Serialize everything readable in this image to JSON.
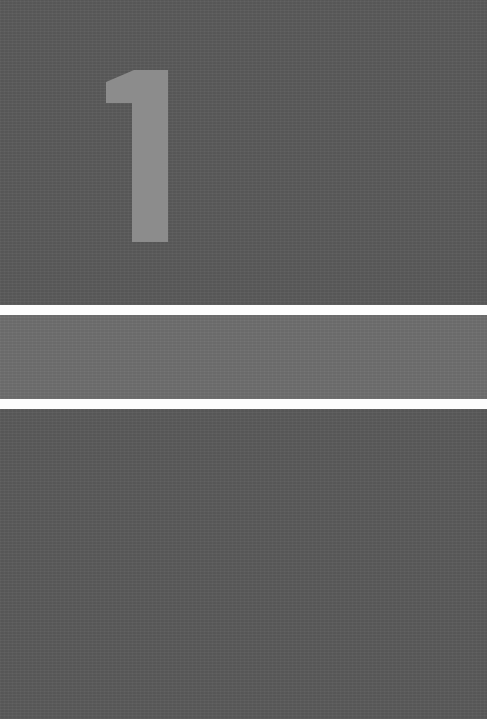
{
  "cover": {
    "numeral": "1",
    "colors": {
      "background": "#5b5b5b",
      "numeral": "#8c8c8c",
      "stripe": "#fdfdfd",
      "band": "#6f6f6f"
    }
  }
}
